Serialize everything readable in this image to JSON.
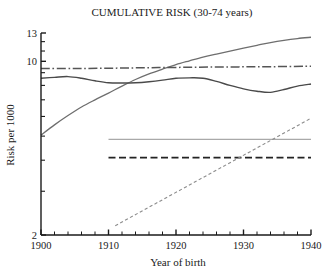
{
  "chart_data": {
    "type": "line",
    "title": "CUMULATIVE RISK (30-74 years)",
    "xlabel": "Year of birth",
    "ylabel": "Risk per 1000",
    "yscale": "log",
    "ylim": [
      2,
      13
    ],
    "xlim": [
      1900,
      1940
    ],
    "ytick_labels": [
      "13",
      "10",
      "2"
    ],
    "ytick_values": [
      13,
      10,
      2
    ],
    "xtick_labels": [
      "1900",
      "1910",
      "1920",
      "1930",
      "1940"
    ],
    "xtick_values": [
      1900,
      1910,
      1920,
      1930,
      1940
    ],
    "x_minor_step": 2,
    "grid": false,
    "legend": "none",
    "series": [
      {
        "name": "rising-solid-gray-upper",
        "style": "solid",
        "color": "#6e6e6e",
        "width": 1.3,
        "points": [
          [
            1900,
            5.05
          ],
          [
            1902,
            5.55
          ],
          [
            1904,
            6.05
          ],
          [
            1906,
            6.55
          ],
          [
            1908,
            7.0
          ],
          [
            1910,
            7.45
          ],
          [
            1912,
            7.95
          ],
          [
            1914,
            8.45
          ],
          [
            1916,
            8.9
          ],
          [
            1918,
            9.3
          ],
          [
            1920,
            9.7
          ],
          [
            1922,
            10.05
          ],
          [
            1924,
            10.4
          ],
          [
            1926,
            10.7
          ],
          [
            1928,
            11.0
          ],
          [
            1930,
            11.3
          ],
          [
            1932,
            11.6
          ],
          [
            1934,
            11.9
          ],
          [
            1936,
            12.15
          ],
          [
            1938,
            12.35
          ],
          [
            1940,
            12.5
          ]
        ]
      },
      {
        "name": "dash-dot-flat",
        "style": "dashdot",
        "color": "#555555",
        "width": 1.5,
        "points": [
          [
            1900,
            9.35
          ],
          [
            1905,
            9.35
          ],
          [
            1910,
            9.38
          ],
          [
            1915,
            9.42
          ],
          [
            1920,
            9.45
          ],
          [
            1925,
            9.48
          ],
          [
            1930,
            9.5
          ],
          [
            1935,
            9.52
          ],
          [
            1940,
            9.55
          ]
        ]
      },
      {
        "name": "wavy-solid-dark",
        "style": "solid",
        "color": "#4a4a4a",
        "width": 1.4,
        "points": [
          [
            1900,
            8.55
          ],
          [
            1902,
            8.62
          ],
          [
            1904,
            8.68
          ],
          [
            1906,
            8.55
          ],
          [
            1908,
            8.35
          ],
          [
            1910,
            8.2
          ],
          [
            1912,
            8.18
          ],
          [
            1914,
            8.2
          ],
          [
            1916,
            8.28
          ],
          [
            1918,
            8.4
          ],
          [
            1920,
            8.55
          ],
          [
            1922,
            8.58
          ],
          [
            1924,
            8.55
          ],
          [
            1926,
            8.3
          ],
          [
            1928,
            8.0
          ],
          [
            1930,
            7.75
          ],
          [
            1932,
            7.58
          ],
          [
            1934,
            7.5
          ],
          [
            1936,
            7.7
          ],
          [
            1938,
            7.95
          ],
          [
            1940,
            8.1
          ]
        ]
      },
      {
        "name": "flat-light-gray",
        "style": "solid",
        "color": "#a9a9a9",
        "width": 1.2,
        "points": [
          [
            1910,
            4.85
          ],
          [
            1940,
            4.85
          ]
        ]
      },
      {
        "name": "flat-dashed-black",
        "style": "dashed",
        "color": "#232323",
        "width": 1.8,
        "points": [
          [
            1910,
            4.1
          ],
          [
            1940,
            4.1
          ]
        ]
      },
      {
        "name": "rising-dashed-gray",
        "style": "finedash",
        "color": "#8c8c8c",
        "width": 1.1,
        "points": [
          [
            1911,
            2.18
          ],
          [
            1940,
            5.9
          ]
        ]
      }
    ]
  }
}
